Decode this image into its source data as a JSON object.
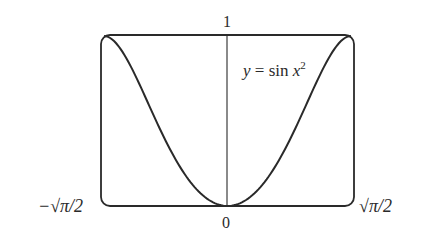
{
  "chart_data": {
    "type": "line",
    "title": "",
    "function_label": "y = sin x²",
    "xlabel": "",
    "ylabel": "",
    "x_ticks": [
      "−√π/2",
      "0",
      "√π/2"
    ],
    "y_ticks": [
      "0",
      "1"
    ],
    "xlim": [
      -1.2533,
      1.2533
    ],
    "ylim": [
      0,
      1
    ],
    "series": [
      {
        "name": "y = sin x^2",
        "x": [
          -1.2533,
          -1.0,
          -0.75,
          -0.5,
          -0.25,
          0,
          0.25,
          0.5,
          0.75,
          1.0,
          1.2533
        ],
        "values": [
          1.0,
          0.8415,
          0.5333,
          0.2474,
          0.0625,
          0,
          0.0625,
          0.2474,
          0.5333,
          0.8415,
          1.0
        ]
      }
    ],
    "grid": false
  },
  "labels": {
    "y_top": "1",
    "x_origin": "0",
    "x_left": "−√π/2",
    "x_right": "√π/2",
    "func_y": "y",
    "func_eq": " = sin ",
    "func_x": "x",
    "func_exp": "2"
  }
}
